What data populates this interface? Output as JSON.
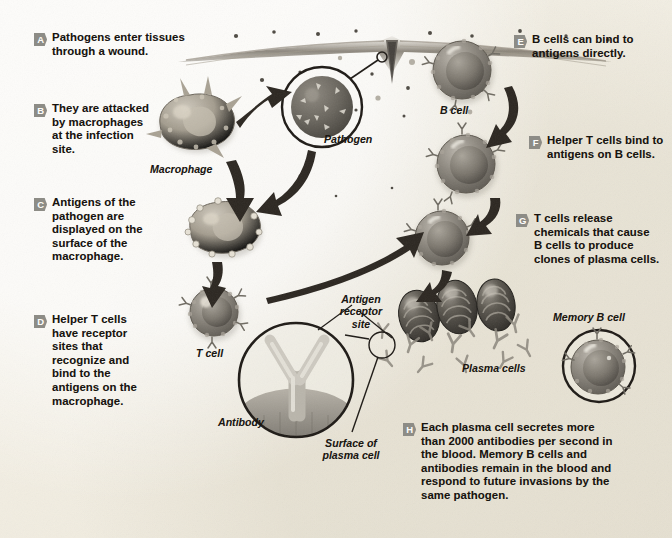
{
  "diagram": {
    "background_color": "#f3efe4",
    "badge_color": "#8d8c86",
    "ink_color": "#1b1714"
  },
  "steps": [
    {
      "letter": "A",
      "text": "Pathogens enter tissues through a wound."
    },
    {
      "letter": "B",
      "text": "They are attacked by macrophages at the infection site."
    },
    {
      "letter": "C",
      "text": "Antigens of the pathogen are displayed on the surface of the macrophage."
    },
    {
      "letter": "D",
      "text": "Helper T cells have receptor sites that recognize and bind to the antigens on the macrophage."
    },
    {
      "letter": "E",
      "text": "B cells can bind to antigens directly."
    },
    {
      "letter": "F",
      "text": "Helper T cells bind to antigens on B cells."
    },
    {
      "letter": "G",
      "text": "T cells release chemicals that cause B cells to produce clones of plasma cells."
    },
    {
      "letter": "H",
      "text": "Each plasma cell secretes more than 2000 antibodies per second in the blood. Memory B cells and antibodies remain in the blood and respond to future invasions by the same pathogen."
    }
  ],
  "labels": {
    "macrophage": "Macrophage",
    "pathogen": "Pathogen",
    "b_cell": "B cell",
    "t_cell": "T cell",
    "antigen_receptor_site": "Antigen\nreceptor\nsite",
    "antibody": "Antibody",
    "surface_of_plasma_cell": "Surface of\nplasma cell",
    "plasma_cells": "Plasma cells",
    "memory_b_cell": "Memory B cell"
  }
}
